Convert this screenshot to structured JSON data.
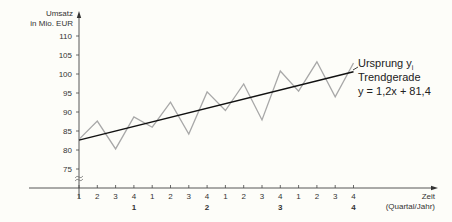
{
  "chart_data": {
    "type": "line",
    "title": "",
    "ylabel_lines": [
      "Umsatz",
      "in Mio. EUR"
    ],
    "xlabel_lines": [
      "Zeit",
      "(Quartal/Jahr)"
    ],
    "ylim": [
      72,
      112
    ],
    "y_ticks": [
      75,
      80,
      85,
      90,
      95,
      100,
      105,
      110
    ],
    "y_axis_break": true,
    "x": [
      1,
      2,
      3,
      4,
      5,
      6,
      7,
      8,
      9,
      10,
      11,
      12,
      13,
      14,
      15,
      16
    ],
    "x_tick_labels": [
      "1",
      "2",
      "3",
      "4",
      "1",
      "2",
      "3",
      "4",
      "1",
      "2",
      "3",
      "4",
      "1",
      "2",
      "3",
      "4"
    ],
    "x_group_labels": [
      {
        "at": 4,
        "label": "1"
      },
      {
        "at": 8,
        "label": "2"
      },
      {
        "at": 12,
        "label": "3"
      },
      {
        "at": 16,
        "label": "4"
      }
    ],
    "grid": false,
    "series": [
      {
        "name": "Ursprung y",
        "name_subscript": "i",
        "color": "#a8a8a8",
        "values": [
          82.8,
          87.6,
          80.3,
          88.7,
          86.0,
          92.6,
          84.2,
          95.3,
          90.4,
          97.4,
          87.9,
          100.8,
          95.5,
          103.2,
          94.0,
          102.9
        ]
      },
      {
        "name": "Trendgerade",
        "equation": "y = 1,2x + 81,4",
        "color": "#111111",
        "slope": 1.2,
        "intercept": 81.4
      }
    ],
    "legend_placement": "right"
  }
}
